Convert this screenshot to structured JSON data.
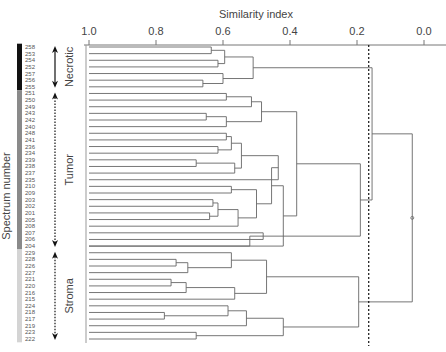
{
  "chart_data": {
    "type": "dendrogram",
    "title": "",
    "xlabel": "Similarity index",
    "ylabel": "Spectrum number",
    "xlim": [
      1.0,
      0.0
    ],
    "x_ticks": [
      {
        "value": 1.0,
        "label": "1.0"
      },
      {
        "value": 0.8,
        "label": "0.8"
      },
      {
        "value": 0.6,
        "label": "0.6"
      },
      {
        "value": 0.4,
        "label": "0.4"
      },
      {
        "value": 0.2,
        "label": "0.2"
      },
      {
        "value": 0.0,
        "label": "0.0"
      }
    ],
    "threshold": {
      "value": 0.165,
      "style": "dashed"
    },
    "leaves": [
      "258",
      "253",
      "254",
      "252",
      "257",
      "256",
      "255",
      "251",
      "250",
      "249",
      "243",
      "242",
      "240",
      "248",
      "241",
      "236",
      "234",
      "239",
      "238",
      "237",
      "235",
      "210",
      "209",
      "203",
      "202",
      "201",
      "205",
      "208",
      "207",
      "206",
      "204",
      "229",
      "228",
      "226",
      "227",
      "221",
      "220",
      "216",
      "215",
      "224",
      "218",
      "217",
      "219",
      "223",
      "222"
    ],
    "groups": [
      {
        "name": "Necrotic",
        "from": 0,
        "to": 6,
        "bar_color": "#111111"
      },
      {
        "name": "Tumor",
        "from": 7,
        "to": 30,
        "bar_color": "#8a8a8a"
      },
      {
        "name": "Stroma",
        "from": 31,
        "to": 44,
        "bar_color": "#d4d4d4"
      }
    ],
    "merges": [
      {
        "id": "a1",
        "children": [
          0,
          1
        ],
        "sim": 0.635
      },
      {
        "id": "a2",
        "children": [
          2,
          3
        ],
        "sim": 0.615
      },
      {
        "id": "a3",
        "children": [
          "a1",
          "a2"
        ],
        "sim": 0.595
      },
      {
        "id": "a4",
        "children": [
          5,
          6
        ],
        "sim": 0.66
      },
      {
        "id": "a5",
        "children": [
          4,
          "a4"
        ],
        "sim": 0.6
      },
      {
        "id": "a6",
        "children": [
          "a3",
          "a5"
        ],
        "sim": 0.51
      },
      {
        "id": "b1",
        "children": [
          7,
          8
        ],
        "sim": 0.59
      },
      {
        "id": "b2",
        "children": [
          "b1",
          9
        ],
        "sim": 0.515
      },
      {
        "id": "b3",
        "children": [
          10,
          11
        ],
        "sim": 0.65
      },
      {
        "id": "b4",
        "children": [
          "b3",
          12
        ],
        "sim": 0.59
      },
      {
        "id": "b5",
        "children": [
          "b2",
          "b4"
        ],
        "sim": 0.485
      },
      {
        "id": "c1",
        "children": [
          13,
          14
        ],
        "sim": 0.59
      },
      {
        "id": "c2",
        "children": [
          15,
          16
        ],
        "sim": 0.615
      },
      {
        "id": "c3",
        "children": [
          "c1",
          "c2"
        ],
        "sim": 0.575
      },
      {
        "id": "c4",
        "children": [
          17,
          18
        ],
        "sim": 0.68
      },
      {
        "id": "c5",
        "children": [
          "c4",
          19
        ],
        "sim": 0.565
      },
      {
        "id": "c6",
        "children": [
          "c3",
          "c5"
        ],
        "sim": 0.545
      },
      {
        "id": "c7",
        "children": [
          "c6",
          20
        ],
        "sim": 0.435
      },
      {
        "id": "c8",
        "children": [
          21,
          22
        ],
        "sim": 0.575
      },
      {
        "id": "c9",
        "children": [
          23,
          24
        ],
        "sim": 0.63
      },
      {
        "id": "c10",
        "children": [
          25,
          26
        ],
        "sim": 0.64
      },
      {
        "id": "c11",
        "children": [
          "c9",
          "c10"
        ],
        "sim": 0.615
      },
      {
        "id": "c12",
        "children": [
          "c11",
          27
        ],
        "sim": 0.555
      },
      {
        "id": "c13",
        "children": [
          "c8",
          "c12"
        ],
        "sim": 0.5
      },
      {
        "id": "c14",
        "children": [
          "c7",
          "c13"
        ],
        "sim": 0.455
      },
      {
        "id": "c15",
        "children": [
          28,
          29
        ],
        "sim": 0.48
      },
      {
        "id": "c16",
        "children": [
          "c15",
          30
        ],
        "sim": 0.52
      },
      {
        "id": "c17",
        "children": [
          "c14",
          30
        ],
        "sim": 0.42
      },
      {
        "id": "d1",
        "children": [
          "b5",
          "c17"
        ],
        "sim": 0.38
      },
      {
        "id": "d2",
        "children": [
          "d1",
          "c15"
        ],
        "sim": 0.19
      },
      {
        "id": "d3",
        "children": [
          "a6",
          "d2"
        ],
        "sim": 0.155
      },
      {
        "id": "e1",
        "children": [
          32,
          33
        ],
        "sim": 0.74
      },
      {
        "id": "e2",
        "children": [
          "e1",
          34
        ],
        "sim": 0.705
      },
      {
        "id": "e3",
        "children": [
          31,
          "e2"
        ],
        "sim": 0.575
      },
      {
        "id": "e4",
        "children": [
          35,
          36
        ],
        "sim": 0.755
      },
      {
        "id": "e5",
        "children": [
          "e4",
          37
        ],
        "sim": 0.71
      },
      {
        "id": "e6",
        "children": [
          "e5",
          38
        ],
        "sim": 0.565
      },
      {
        "id": "e7",
        "children": [
          "e3",
          "e6"
        ],
        "sim": 0.47
      },
      {
        "id": "e8",
        "children": [
          40,
          41
        ],
        "sim": 0.775
      },
      {
        "id": "e9",
        "children": [
          39,
          "e8"
        ],
        "sim": 0.585
      },
      {
        "id": "e10",
        "children": [
          "e9",
          42
        ],
        "sim": 0.53
      },
      {
        "id": "e11",
        "children": [
          43,
          44
        ],
        "sim": 0.68
      },
      {
        "id": "e12",
        "children": [
          "e10",
          "e11"
        ],
        "sim": 0.42
      },
      {
        "id": "e13",
        "children": [
          "e7",
          "e12"
        ],
        "sim": 0.195
      },
      {
        "id": "root",
        "children": [
          "d3",
          "e13"
        ],
        "sim": 0.035
      }
    ],
    "grid": false,
    "legend": "none"
  },
  "labels": {
    "x_axis_title": "Similarity index",
    "y_axis_title": "Spectrum number",
    "groups": [
      "Necrotic",
      "Tumor",
      "Stroma"
    ]
  }
}
